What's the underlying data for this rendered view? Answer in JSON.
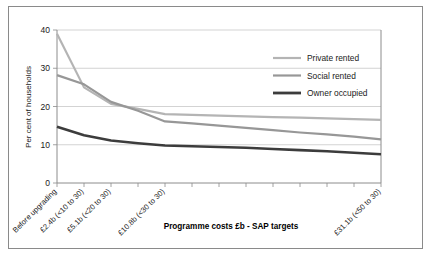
{
  "chart_data": {
    "type": "line",
    "title": "",
    "xlabel": "Programme costs £b - SAP targets",
    "ylabel": "Per cent of households",
    "ylim": [
      0,
      40
    ],
    "yticks": [
      0,
      10,
      20,
      30,
      40
    ],
    "ytick_labels": [
      "0",
      "10",
      "20",
      "30",
      "40"
    ],
    "grid": true,
    "legend_position": "upper right",
    "x_tick_count": 13,
    "categories": [
      "Before upgrading",
      "£2.4b (<10 to 30)",
      "£5.1b (<20 to 30)",
      "",
      "£10.8b (<30 to 30)",
      "",
      "",
      "",
      "",
      "",
      "",
      "",
      "£31.1b (<50 to 30)"
    ],
    "labelled_categories": [
      {
        "index": 0,
        "label": "Before upgrading"
      },
      {
        "index": 1,
        "label": "£2.4b (<10 to 30)"
      },
      {
        "index": 2,
        "label": "£5.1b (<20 to 30)"
      },
      {
        "index": 4,
        "label": "£10.8b (<30 to 30)"
      },
      {
        "index": 12,
        "label": "£31.1b (<50 to 30)"
      }
    ],
    "series": [
      {
        "name": "Private rented",
        "color": "#b4b4b4",
        "width": 2.2,
        "values": [
          39.0,
          25.0,
          20.7,
          19.4,
          18.0,
          17.8,
          17.6,
          17.4,
          17.2,
          17.1,
          16.9,
          16.7,
          16.5
        ]
      },
      {
        "name": "Social rented",
        "color": "#979797",
        "width": 2.2,
        "values": [
          28.2,
          25.8,
          21.2,
          18.9,
          16.1,
          15.6,
          15.0,
          14.4,
          13.8,
          13.2,
          12.7,
          12.1,
          11.4
        ]
      },
      {
        "name": "Owner occupied",
        "color": "#3c3c3c",
        "width": 2.6,
        "values": [
          14.7,
          12.5,
          11.1,
          10.4,
          9.8,
          9.6,
          9.4,
          9.2,
          8.9,
          8.6,
          8.3,
          7.9,
          7.5
        ]
      }
    ]
  },
  "legend": {
    "items": [
      {
        "label": "Private rented",
        "color": "#b4b4b4"
      },
      {
        "label": "Social rented",
        "color": "#979797"
      },
      {
        "label": "Owner occupied",
        "color": "#3c3c3c"
      }
    ]
  },
  "axes": {
    "y_title": "Per cent of households",
    "x_title": "Programme costs £b - SAP targets",
    "y_tick_labels": [
      "40",
      "30",
      "20",
      "10",
      "0"
    ]
  }
}
